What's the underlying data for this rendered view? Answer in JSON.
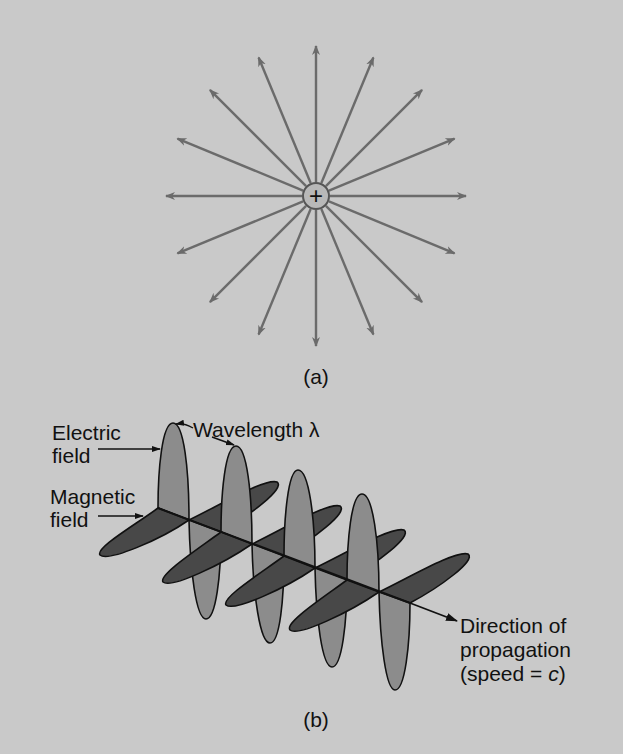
{
  "colors": {
    "background": "#c9c9c9",
    "field_lines": "#6b6b6b",
    "electric_lobe": "#8c8c8c",
    "magnetic_lobe": "#484848",
    "outline": "#111111",
    "charge_fill": "#b8b8b8"
  },
  "panel_a": {
    "caption": "(a)",
    "charge_symbol": "+",
    "center": [
      316,
      196
    ],
    "arrow_count": 16,
    "arrow_length": 150
  },
  "panel_b": {
    "caption": "(b)",
    "labels": {
      "electric_line1": "Electric",
      "electric_line2": "field",
      "magnetic_line1": "Magnetic",
      "magnetic_line2": "field",
      "wavelength": "Wavelength λ",
      "direction_line1": "Direction of",
      "direction_line2": "propagation",
      "direction_line3_prefix": "(speed = ",
      "direction_line3_var": "c",
      "direction_line3_suffix": ")"
    }
  }
}
